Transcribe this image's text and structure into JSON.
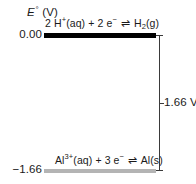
{
  "chart_data": {
    "type": "bar",
    "title": "",
    "ylabel": "E° (V)",
    "xlabel": "",
    "ylim": [
      -1.66,
      0.0
    ],
    "grid": false,
    "legend": null,
    "categories": [
      "2 H+(aq) + 2 e- ⇌ H2(g)",
      "Al3+(aq) + 3 e- ⇌ Al(s)"
    ],
    "values": [
      0.0,
      -1.66
    ],
    "annotations": [
      "1.66 V"
    ]
  },
  "axis": {
    "symbol": "E",
    "degree": "°",
    "unit": "(V)"
  },
  "levels": [
    {
      "id": "hydrogen",
      "tick_label": "0.00",
      "value": 0.0,
      "color": "#000000",
      "equation": {
        "coefficient": "2 H",
        "charge": "+",
        "state1": "(aq) + 2 e",
        "electron_charge": "−",
        "arrow": "⇌",
        "product": "H",
        "product_sub": "2",
        "product_state": "(g)"
      }
    },
    {
      "id": "aluminium",
      "tick_label": "−1.66",
      "value": -1.66,
      "color": "#b4b4b4",
      "equation": {
        "coefficient": "Al",
        "charge": "3+",
        "state1": "(aq) + 3 e",
        "electron_charge": "−",
        "arrow": "⇌",
        "product": "Al",
        "product_sub": "",
        "product_state": "(s)"
      }
    }
  ],
  "measurement": {
    "label": "1.66 V",
    "color": "#3a3a3a"
  }
}
